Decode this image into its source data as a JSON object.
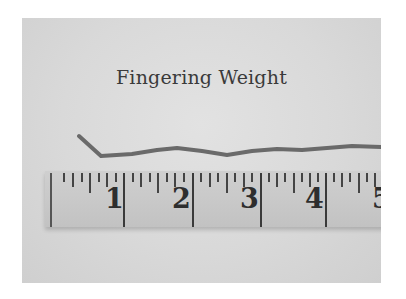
{
  "title": "Fingering Weight",
  "colors": {
    "background": "#dcdcdc",
    "ruler": "#c8c8c8",
    "yarn": "#6a6a6a",
    "text": "#3a3a3a"
  },
  "ruler": {
    "numbers": [
      "1",
      "2",
      "3",
      "4",
      "5"
    ]
  }
}
